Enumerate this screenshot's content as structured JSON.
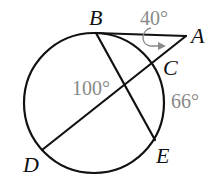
{
  "diagram": {
    "type": "circle-secants-tangent",
    "circle": {
      "cx": 94,
      "cy": 103,
      "r": 70
    },
    "points": [
      {
        "id": "B",
        "label": "B",
        "x": 96,
        "y": 33,
        "label_x": 89,
        "label_y": 25
      },
      {
        "id": "A",
        "label": "A",
        "x": 186,
        "y": 36,
        "label_x": 191,
        "label_y": 43
      },
      {
        "id": "C",
        "label": "C",
        "x": 153,
        "y": 63,
        "label_x": 163,
        "label_y": 75
      },
      {
        "id": "D",
        "label": "D",
        "x": 42,
        "y": 150,
        "label_x": 23,
        "label_y": 172
      },
      {
        "id": "E",
        "label": "E",
        "x": 155,
        "y": 140,
        "label_x": 156,
        "label_y": 163
      }
    ],
    "segments": [
      {
        "id": "tangent-BA",
        "from": "B",
        "to": "A"
      },
      {
        "id": "secant-AD",
        "from": "A",
        "to": "D"
      },
      {
        "id": "chord-BE",
        "from": "B",
        "to": "E"
      }
    ],
    "measures": [
      {
        "id": "angle-A",
        "label": "40°",
        "x": 140,
        "y": 25
      },
      {
        "id": "arc-BD",
        "label": "100°",
        "x": 72,
        "y": 95
      },
      {
        "id": "arc-CE",
        "label": "66°",
        "x": 171,
        "y": 108
      }
    ],
    "colors": {
      "line": "#111111",
      "measure": "#8a8a8a"
    }
  }
}
